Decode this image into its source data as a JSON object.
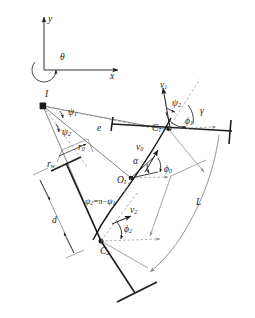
{
  "figure": {
    "background_color": "#ffffff",
    "stroke_color": "#1b1b1b",
    "light_stroke_color": "#8d8d8d",
    "dashed_color": "#9a9a9a"
  },
  "axes": {
    "y_label": "y",
    "x_label": "x",
    "origin_angle_label": "θ"
  },
  "points": {
    "instant_centre": "I",
    "centre_1": "C",
    "centre_1_sub": "1",
    "centre_2": "C",
    "centre_2_sub": "2",
    "body_origin": "O",
    "body_origin_sub": "I"
  },
  "lengths": {
    "offset": "e",
    "radius_0": "r",
    "radius_0_sub": "0",
    "wheel_radius": "r",
    "wheel_radius_sub": "w",
    "axle_distance": "d",
    "arc_length": "L"
  },
  "angles": {
    "alpha": "α",
    "gamma": "γ",
    "psi_1": "ψ",
    "psi_1_sub": "1",
    "psi_2": "ψ",
    "psi_2_sub": "2",
    "psi_relation": "ψ",
    "psi_relation_sub": "2",
    "psi_relation_eq": "=π−",
    "psi_relation_tail": "ψ",
    "psi_relation_tail_sub": "1",
    "phi_0": "ϕ",
    "phi_0_sub": "0",
    "phi_1": "ϕ",
    "phi_1_sub": "1",
    "phi_2": "ϕ",
    "phi_2_sub": "2"
  },
  "velocities": {
    "v_0": "v",
    "v_0_sub": "0",
    "v_1": "v",
    "v_1_sub": "1",
    "v_2": "v",
    "v_2_sub": "2"
  }
}
